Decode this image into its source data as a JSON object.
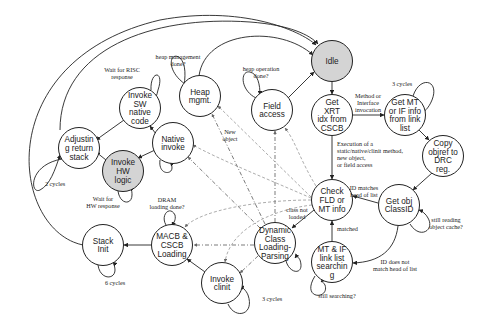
{
  "diagram": {
    "type": "state-machine",
    "colors": {
      "highlight_fill": "#d4d4d4",
      "default_fill": "#ffffff",
      "line": "#222222"
    },
    "nodes": [
      {
        "id": "idle",
        "lines": [
          "Idle"
        ],
        "highlighted": true
      },
      {
        "id": "heap",
        "lines": [
          "Heap",
          "mgmt."
        ],
        "highlighted": false
      },
      {
        "id": "field",
        "lines": [
          "Field",
          "access"
        ],
        "highlighted": false
      },
      {
        "id": "xrt",
        "lines": [
          "Get",
          "XRT",
          "idx from",
          "CSCB"
        ],
        "highlighted": false
      },
      {
        "id": "getmt",
        "lines": [
          "Get MT",
          "or IF info",
          "from link",
          "list"
        ],
        "highlighted": false
      },
      {
        "id": "copy",
        "lines": [
          "Copy",
          "objref to",
          "DRC",
          "reg."
        ],
        "highlighted": false
      },
      {
        "id": "swnative",
        "lines": [
          "Invoke",
          "SW",
          "native",
          "code"
        ],
        "highlighted": false
      },
      {
        "id": "native",
        "lines": [
          "Native",
          "invoke"
        ],
        "highlighted": false
      },
      {
        "id": "adjust",
        "lines": [
          "Adjustin",
          "g return",
          "stack"
        ],
        "highlighted": false
      },
      {
        "id": "hw",
        "lines": [
          "Invoke",
          "HW",
          "logic"
        ],
        "highlighted": true
      },
      {
        "id": "check",
        "lines": [
          "Check",
          "FLD or",
          "MT info"
        ],
        "highlighted": false
      },
      {
        "id": "classid",
        "lines": [
          "Get obj",
          "ClassID"
        ],
        "highlighted": false
      },
      {
        "id": "macb",
        "lines": [
          "MACB &",
          "CSCB",
          "Loading"
        ],
        "highlighted": false
      },
      {
        "id": "stack",
        "lines": [
          "Stack",
          "Init"
        ],
        "highlighted": false
      },
      {
        "id": "dcl",
        "lines": [
          "Dynamic",
          "Class",
          "Loading-",
          "Parsing"
        ],
        "highlighted": false
      },
      {
        "id": "search",
        "lines": [
          "MT & IF",
          "link list",
          "searchin",
          "g"
        ],
        "highlighted": false
      },
      {
        "id": "clinit",
        "lines": [
          "Invoke",
          "clinit"
        ],
        "highlighted": false
      }
    ],
    "edge_labels": {
      "heap_loop": [
        "heap management",
        "done?"
      ],
      "field_loop": [
        "heap operation",
        "done?"
      ],
      "swnative_loop": [
        "Wait for RISC",
        "response"
      ],
      "hw_loop": [
        "Wait for",
        "HW response"
      ],
      "adjust_loop": [
        "2 cycles"
      ],
      "getmt_loop": [
        "3 cycles"
      ],
      "macb_loop": [
        "DRAM",
        "loading done?"
      ],
      "stack_loop": [
        "6 cycles"
      ],
      "clinit_loop": [
        "3 cycles"
      ],
      "classid_loop": [
        "still reading",
        "object cache?"
      ],
      "search_loop": [
        "still searching?"
      ],
      "xrt_to_getmt": [
        "Method or",
        "Interface",
        "invocation"
      ],
      "xrt_to_check": [
        "Execution of a",
        "static/native/clinit method,",
        "new object,",
        "or field access"
      ],
      "classid_to_check": [
        "ID matches",
        "head of list"
      ],
      "classid_to_search": [
        "ID does not",
        "match head of list"
      ],
      "search_to_check": [
        "matched"
      ],
      "check_to_dcl": [
        "class not",
        "loaded"
      ],
      "new_object": [
        "New",
        "object"
      ]
    }
  }
}
